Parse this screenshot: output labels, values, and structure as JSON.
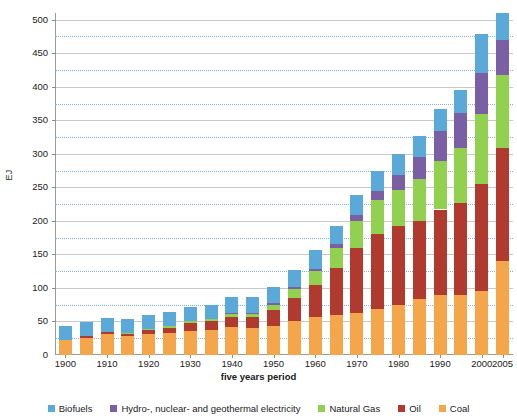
{
  "chart_data": {
    "type": "bar",
    "stacked": true,
    "title": "",
    "xlabel": "five years period",
    "ylabel": "EJ",
    "ylim": [
      0,
      510
    ],
    "ytick_step": 50,
    "minor_grid_step": 25,
    "grid": true,
    "legend_position": "bottom",
    "categories": [
      "1900",
      "1905",
      "1910",
      "1915",
      "1920",
      "1925",
      "1930",
      "1935",
      "1940",
      "1945",
      "1950",
      "1955",
      "1960",
      "1965",
      "1970",
      "1975",
      "1980",
      "1985",
      "1990",
      "1995",
      "2000",
      "2005"
    ],
    "xtick_labels": [
      "1900",
      "1910",
      "1920",
      "1930",
      "1940",
      "1950",
      "1960",
      "1970",
      "1980",
      "1990",
      "2000",
      "2005"
    ],
    "ytick_labels": [
      "0",
      "50",
      "100",
      "150",
      "200",
      "250",
      "300",
      "350",
      "400",
      "450",
      "500"
    ],
    "series": [
      {
        "name": "Coal",
        "color": "#F5A64B",
        "values": [
          22,
          26,
          31,
          28,
          32,
          33,
          36,
          38,
          42,
          40,
          44,
          50,
          57,
          60,
          63,
          68,
          74,
          83,
          90,
          90,
          95,
          140
        ]
      },
      {
        "name": "Oil",
        "color": "#B03A2E",
        "values": [
          1,
          2,
          3,
          4,
          6,
          8,
          11,
          12,
          15,
          16,
          23,
          35,
          48,
          70,
          97,
          113,
          118,
          117,
          127,
          137,
          160,
          168
        ]
      },
      {
        "name": "Natural Gas",
        "color": "#92D050",
        "values": [
          0,
          0,
          0,
          1,
          1,
          2,
          3,
          3,
          4,
          5,
          8,
          13,
          20,
          29,
          40,
          50,
          54,
          63,
          72,
          82,
          105,
          110
        ]
      },
      {
        "name": "Hydro-, nuclear- and geothermal electricity",
        "color": "#7B5FA5",
        "values": [
          0,
          0,
          0,
          0,
          0,
          0,
          0,
          1,
          1,
          1,
          2,
          3,
          4,
          6,
          9,
          14,
          23,
          32,
          45,
          52,
          60,
          52
        ]
      },
      {
        "name": "Biofuels",
        "color": "#5BA9D8",
        "values": [
          20,
          21,
          21,
          21,
          21,
          21,
          21,
          21,
          24,
          24,
          25,
          26,
          27,
          28,
          29,
          30,
          31,
          32,
          33,
          34,
          58,
          40
        ]
      }
    ],
    "totals": [
      43,
      49,
      55,
      54,
      60,
      64,
      71,
      75,
      86,
      86,
      102,
      127,
      156,
      193,
      238,
      275,
      300,
      327,
      367,
      395,
      478,
      510
    ]
  },
  "legend": {
    "items": [
      {
        "label": "Biofuels",
        "color": "#5BA9D8"
      },
      {
        "label": "Hydro-, nuclear- and geothermal electricity",
        "color": "#7B5FA5"
      },
      {
        "label": "Natural Gas",
        "color": "#92D050"
      },
      {
        "label": "Oil",
        "color": "#B03A2E"
      },
      {
        "label": "Coal",
        "color": "#F5A64B"
      }
    ]
  }
}
